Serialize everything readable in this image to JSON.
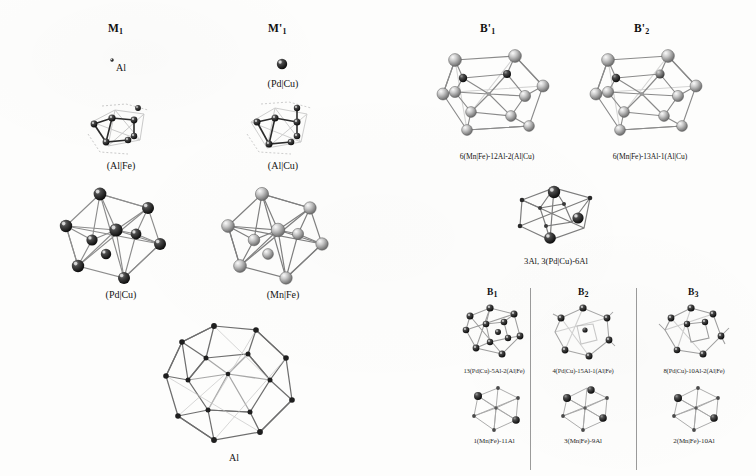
{
  "figure": {
    "type": "scientific-structure-figure",
    "background_color": "#fdfdfc",
    "ink_color": "#1a1a1a"
  },
  "columns": {
    "m1": {
      "header": "M",
      "header_sub": "1",
      "items": [
        {
          "name": "single-atom-al",
          "label": "Al"
        },
        {
          "name": "cluster-al-fe",
          "label": "(Al|Fe)"
        },
        {
          "name": "icosahedron-pd-cu",
          "label": "(Pd|Cu)"
        }
      ]
    },
    "m1prime": {
      "header": "M'",
      "header_sub": "1",
      "items": [
        {
          "name": "single-atom-pd-cu",
          "label": "(Pd|Cu)"
        },
        {
          "name": "cluster-al-cu",
          "label": "(Al|Cu)"
        },
        {
          "name": "icosahedron-mn-fe",
          "label": "(Mn|Fe)"
        }
      ]
    },
    "bottom_left": {
      "name": "large-polyhedron-al",
      "label": "Al"
    }
  },
  "right_top": {
    "b1prime": {
      "header": "B'",
      "header_sub": "1",
      "caption": "6(Mn|Fe)-12Al-2(Al|Cu)"
    },
    "b2prime": {
      "header": "B'",
      "header_sub": "2",
      "caption": "6(Mn|Fe)-13Al-1(Al|Cu)"
    },
    "center_cluster": {
      "name": "cluster-3al-3pdcu-6al",
      "caption": "3Al, 3(Pd|Cu)-6Al"
    }
  },
  "right_bottom": {
    "panels": [
      {
        "header": "B",
        "header_sub": "1",
        "top_caption": "13(Pd|Cu)-5Al-2(Al|Fe)",
        "bottom_caption": "1(Mn|Fe)-11Al"
      },
      {
        "header": "B",
        "header_sub": "2",
        "top_caption": "4(Pd|Cu)-15Al-1(Al|Fe)",
        "bottom_caption": "3(Mn|Fe)-9Al"
      },
      {
        "header": "B",
        "header_sub": "3",
        "top_caption": "8(Pd|Cu)-10Al-2(Al|Fe)",
        "bottom_caption": "2(Mn|Fe)-10Al"
      }
    ]
  }
}
